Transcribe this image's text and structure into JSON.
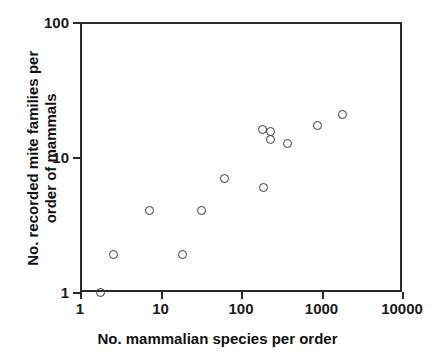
{
  "chart_data": {
    "type": "scatter",
    "title": "",
    "xlabel": "No. mammalian species per order",
    "ylabel_line1": "No. recorded mite families per",
    "ylabel_line2": "order of mammals",
    "xscale": "log",
    "yscale": "log",
    "xlim": [
      1,
      10000
    ],
    "ylim": [
      1,
      100
    ],
    "xticks": [
      1,
      10,
      100,
      1000,
      10000
    ],
    "xticklabels": [
      "1",
      "10",
      "100",
      "1000",
      "10000"
    ],
    "yticks": [
      1,
      10,
      100
    ],
    "yticklabels": [
      "1",
      "10",
      "100"
    ],
    "grid": false,
    "legend": null,
    "marker": "open-circle",
    "marker_color": "#3a3a3a",
    "frame_color": "#2b2b2b",
    "background": "#ffffff",
    "n_points": 13,
    "points": [
      {
        "x": 1.8,
        "y": 1.0
      },
      {
        "x": 2.6,
        "y": 1.9
      },
      {
        "x": 7.3,
        "y": 4.0
      },
      {
        "x": 19,
        "y": 1.9
      },
      {
        "x": 32,
        "y": 4.0
      },
      {
        "x": 63,
        "y": 6.9
      },
      {
        "x": 190,
        "y": 5.9
      },
      {
        "x": 185,
        "y": 16.0
      },
      {
        "x": 235,
        "y": 15.5
      },
      {
        "x": 235,
        "y": 13.5
      },
      {
        "x": 380,
        "y": 12.5
      },
      {
        "x": 880,
        "y": 17.0
      },
      {
        "x": 1800,
        "y": 20.5
      }
    ]
  }
}
